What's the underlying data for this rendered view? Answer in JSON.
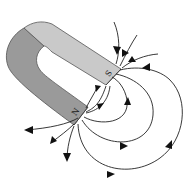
{
  "figure": {
    "poles": {
      "north": "N",
      "south": "S"
    },
    "colors": {
      "magnet_light": "#c9c9c9",
      "magnet_dark": "#9a9a9a",
      "magnet_edge": "#555555",
      "field_line": "#222222",
      "background": "#ffffff"
    },
    "field_line_direction": "from N pole to S pole"
  }
}
